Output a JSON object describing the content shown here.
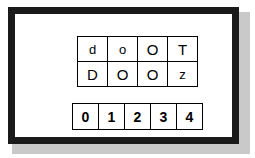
{
  "figure": {
    "background_color": "#ffffff",
    "frame_color": "#1a1a1a",
    "shadow_color": "#c9c9c9",
    "cell_border_color": "#000000",
    "text_color": "#000000"
  },
  "letter_grid": {
    "rows": [
      [
        {
          "char": "d",
          "case": "lower"
        },
        {
          "char": "o",
          "case": "lower"
        },
        {
          "char": "O",
          "case": "upper"
        },
        {
          "char": "T",
          "case": "upper"
        }
      ],
      [
        {
          "char": "D",
          "case": "upper"
        },
        {
          "char": "O",
          "case": "upper"
        },
        {
          "char": "O",
          "case": "upper"
        },
        {
          "char": "z",
          "case": "lower"
        }
      ]
    ]
  },
  "number_grid": {
    "rows": [
      [
        {
          "char": "0"
        },
        {
          "char": "1"
        },
        {
          "char": "2"
        },
        {
          "char": "3"
        },
        {
          "char": "4"
        }
      ]
    ]
  }
}
